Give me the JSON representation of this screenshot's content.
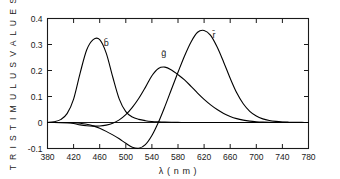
{
  "chart_data": {
    "type": "line",
    "title": "",
    "xlabel": "λ ( n m )",
    "ylabel": "T R I S T I M U L U S   V A L U E S",
    "xlim": [
      380,
      780
    ],
    "ylim": [
      -0.1,
      0.4
    ],
    "xticks": [
      380,
      420,
      460,
      500,
      540,
      580,
      620,
      660,
      700,
      740,
      780
    ],
    "xtick_labels": [
      "380",
      "420",
      "460",
      "500",
      "540",
      "580",
      "620",
      "660",
      "700",
      "740",
      "780"
    ],
    "yticks": [
      -0.1,
      0,
      0.1,
      0.2,
      0.3,
      0.4
    ],
    "ytick_labels": [
      "-0.1",
      "0",
      "0.1",
      "0.2",
      "0.3",
      "0.4"
    ],
    "grid": false,
    "legend": "inline-annotations",
    "annotations": [
      {
        "text": "b̄",
        "x": 470,
        "y": 0.295,
        "name": "b-bar-label"
      },
      {
        "text": "ḡ",
        "x": 558,
        "y": 0.255,
        "name": "g-bar-label"
      },
      {
        "text": "r̄",
        "x": 635,
        "y": 0.325,
        "name": "r-bar-label"
      }
    ],
    "x": [
      380,
      390,
      400,
      410,
      420,
      430,
      440,
      450,
      460,
      470,
      480,
      490,
      500,
      510,
      520,
      530,
      540,
      550,
      560,
      570,
      580,
      590,
      600,
      610,
      620,
      630,
      640,
      650,
      660,
      670,
      680,
      690,
      700,
      710,
      720,
      730,
      740,
      750,
      760,
      770,
      780
    ],
    "series": [
      {
        "name": "r̄",
        "label": "r-bar",
        "color": "#000000",
        "peak_value": 0.355,
        "peak_x": 605,
        "min_value": -0.1,
        "min_x": 512,
        "values": [
          0.0,
          0.0,
          -0.0001,
          -0.0004,
          -0.0012,
          -0.003,
          -0.0069,
          -0.013,
          -0.0224,
          -0.0341,
          -0.0476,
          -0.0627,
          -0.08,
          -0.0955,
          -0.099,
          -0.085,
          -0.05,
          0.001,
          0.062,
          0.128,
          0.193,
          0.256,
          0.31,
          0.347,
          0.354,
          0.335,
          0.29,
          0.232,
          0.17,
          0.114,
          0.072,
          0.043,
          0.025,
          0.014,
          0.0077,
          0.0042,
          0.0022,
          0.0012,
          0.0006,
          0.0003,
          0.0001
        ]
      },
      {
        "name": "ḡ",
        "label": "g-bar",
        "color": "#000000",
        "peak_value": 0.214,
        "peak_x": 545,
        "min_value": -0.014,
        "min_x": 455,
        "values": [
          0.0,
          -0.0001,
          -0.0004,
          -0.0012,
          -0.004,
          -0.009,
          -0.0125,
          -0.014,
          -0.0135,
          -0.01,
          -0.003,
          0.01,
          0.03,
          0.058,
          0.093,
          0.135,
          0.18,
          0.208,
          0.213,
          0.202,
          0.184,
          0.164,
          0.139,
          0.113,
          0.089,
          0.068,
          0.05,
          0.035,
          0.0235,
          0.015,
          0.0092,
          0.0054,
          0.0031,
          0.0017,
          0.0009,
          0.0005,
          0.0003,
          0.0001,
          0.0001,
          0.0,
          0.0
        ]
      },
      {
        "name": "b̄",
        "label": "b-bar",
        "color": "#000000",
        "peak_value": 0.32,
        "peak_x": 450,
        "values": [
          0.0,
          0.003,
          0.011,
          0.034,
          0.09,
          0.19,
          0.279,
          0.319,
          0.319,
          0.267,
          0.175,
          0.09,
          0.042,
          0.021,
          0.012,
          0.007,
          0.004,
          0.0024,
          0.0014,
          0.0008,
          0.0004,
          0.0002,
          0.0001,
          0.0001,
          0.0,
          0.0,
          0.0,
          0.0,
          0.0,
          0.0,
          0.0,
          0.0,
          0.0,
          0.0,
          0.0,
          0.0,
          0.0,
          0.0,
          0.0,
          0.0,
          0.0
        ]
      }
    ]
  }
}
